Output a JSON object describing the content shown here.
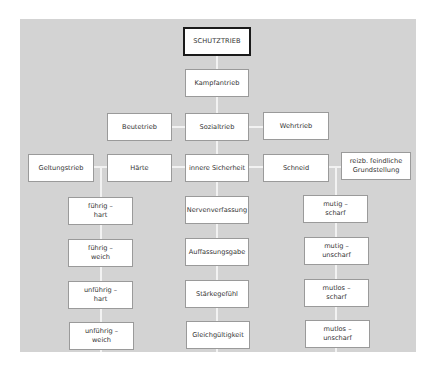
{
  "diagram": {
    "colors": {
      "panel": "#d3d3d3",
      "box": "#ffffff",
      "connector": "#f2f2f2",
      "root_border": "#1a1a1a"
    },
    "root": "SCHUTZTRIEB",
    "level1": "Kampfantrieb",
    "level2": [
      "Beutetrieb",
      "Sozialtrieb",
      "Wehrtrieb"
    ],
    "level3": [
      "Geltungstrieb",
      "Härte",
      "innere Sicherheit",
      "Schneid",
      "reizb. feindliche\nGrundstellung"
    ],
    "haerte_column": [
      "führig –\nhart",
      "führig –\nweich",
      "unführig –\nhart",
      "unführig –\nweich"
    ],
    "sicherheit_column": [
      "Nervenverfassung",
      "Auffassungsgabe",
      "Stärkegefühl",
      "Gleichgültigkeit"
    ],
    "schneid_column": [
      "mutig –\nscharf",
      "mutig –\nunscharf",
      "mutlos –\nscharf",
      "mutlos –\nunscharf"
    ]
  }
}
